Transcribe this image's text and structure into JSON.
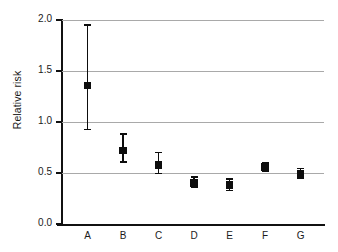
{
  "chart_data": {
    "type": "scatter",
    "title": "",
    "xlabel": "",
    "ylabel": "Relative risk",
    "categories": [
      "A",
      "B",
      "C",
      "D",
      "E",
      "F",
      "G"
    ],
    "values": [
      1.36,
      0.72,
      0.58,
      0.4,
      0.38,
      0.56,
      0.49
    ],
    "error_low": [
      0.92,
      0.6,
      0.49,
      0.35,
      0.32,
      0.51,
      0.44
    ],
    "error_high": [
      1.96,
      0.89,
      0.71,
      0.47,
      0.45,
      0.61,
      0.55
    ],
    "ylim": [
      0.0,
      2.0
    ],
    "ytick_labels": [
      "0.0",
      "0.5",
      "1.0",
      "1.5",
      "2.0"
    ],
    "ytick_values": [
      0.0,
      0.5,
      1.0,
      1.5,
      2.0
    ],
    "grid": true,
    "grid_axis": "y",
    "legend": false,
    "marker_style": "square",
    "marker_color": "#0d0d0d",
    "errorbar_color": "#0d0d0d",
    "gridline_color": "#a9a9a9",
    "axis_color": "#111111",
    "background_color": "#ffffff"
  }
}
